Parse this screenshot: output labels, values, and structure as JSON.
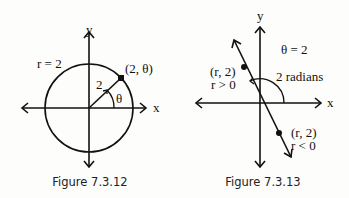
{
  "figures": [
    {
      "caption": "Figure 7.3.12",
      "labels": {
        "y_axis": "y",
        "x_axis": "x",
        "circle": "r = 2",
        "point": "(2, θ)",
        "radius": "2",
        "angle": "θ"
      }
    },
    {
      "caption": "Figure 7.3.13",
      "labels": {
        "y_axis": "y",
        "x_axis": "x",
        "equation": "θ = 2",
        "angle": "2 radians",
        "point_upper": "(r, 2)",
        "point_upper_cond": "r > 0",
        "point_lower": "(r, 2)",
        "point_lower_cond": "r < 0"
      }
    }
  ]
}
